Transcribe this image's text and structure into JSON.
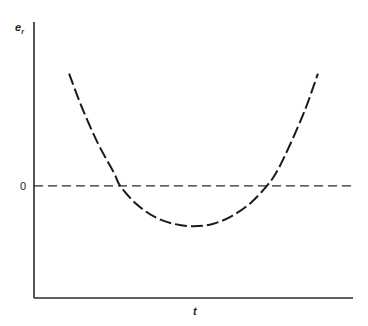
{
  "chart_data": {
    "type": "line",
    "title": "",
    "xlabel": "t",
    "ylabel": "e_r",
    "ylabel_main": "e",
    "ylabel_sub": "r",
    "xlim": [
      0,
      1
    ],
    "ylim": [
      -1.0,
      1.46
    ],
    "y_ticks": [
      {
        "value": 0,
        "label": "0"
      }
    ],
    "x_ticks": [],
    "grid": false,
    "legend": "none",
    "reference_lines": [
      {
        "name": "zero-line",
        "y": 0,
        "style": "dashed"
      }
    ],
    "series": [
      {
        "name": "e_r(t)",
        "style": "dashed",
        "x": [
          0.11,
          0.15,
          0.2,
          0.25,
          0.27,
          0.32,
          0.38,
          0.44,
          0.5,
          0.56,
          0.62,
          0.68,
          0.73,
          0.76,
          0.8,
          0.85,
          0.89
        ],
        "y": [
          1.0,
          0.7,
          0.38,
          0.12,
          0.0,
          -0.16,
          -0.28,
          -0.34,
          -0.36,
          -0.34,
          -0.27,
          -0.15,
          0.0,
          0.12,
          0.35,
          0.68,
          1.0
        ]
      }
    ]
  }
}
